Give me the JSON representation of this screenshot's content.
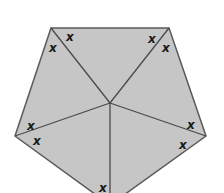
{
  "diagram": {
    "shape": "regular pentagon divided into 5 triangles from center",
    "fill_color": "#c6c6c6",
    "line_color": "#5a5a5a",
    "vertices": [
      [
        51,
        28
      ],
      [
        169,
        28
      ],
      [
        206,
        136
      ],
      [
        110,
        205
      ],
      [
        15,
        136
      ]
    ],
    "center": [
      110,
      103
    ],
    "angle_marks": [
      {
        "label": "x",
        "x": 70,
        "y": 37
      },
      {
        "label": "x",
        "x": 53,
        "y": 48
      },
      {
        "label": "x",
        "x": 152,
        "y": 39
      },
      {
        "label": "x",
        "x": 166,
        "y": 48
      },
      {
        "label": "x",
        "x": 31,
        "y": 126
      },
      {
        "label": "x",
        "x": 37,
        "y": 141
      },
      {
        "label": "x",
        "x": 191,
        "y": 125
      },
      {
        "label": "x",
        "x": 183,
        "y": 145
      },
      {
        "label": "x",
        "x": 103,
        "y": 188
      }
    ]
  }
}
